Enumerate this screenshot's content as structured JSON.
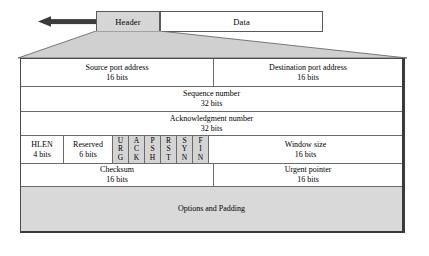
{
  "diagram": {
    "colors": {
      "shaded_fill": "#d9d9d9",
      "flag_fill": "#d4d4d4",
      "header_fill": "#d6d6d6",
      "data_fill": "#ffffff",
      "border": "#4a4a4a",
      "arrow": "#3b3b3b",
      "fan_fill": "#d0d0d0"
    },
    "segment": {
      "header_label": "Header",
      "data_label": "Data",
      "arrow_icon": "left-arrow-icon",
      "arrow_direction": "left"
    },
    "rows": [
      {
        "id": "ports",
        "cells": [
          {
            "name": "source-port",
            "line1": "Source port address",
            "line2": "16 bits",
            "shaded": false
          },
          {
            "name": "destination-port",
            "line1": "Destination port address",
            "line2": "16 bits",
            "shaded": false
          }
        ]
      },
      {
        "id": "sequence",
        "cells": [
          {
            "name": "sequence-number",
            "line1": "Sequence number",
            "line2": "32 bits",
            "shaded": false
          }
        ]
      },
      {
        "id": "acknowledgment",
        "cells": [
          {
            "name": "acknowledgment-number",
            "line1": "Acknowledgment number",
            "line2": "32 bits",
            "shaded": false
          }
        ]
      },
      {
        "id": "flags",
        "cells": [
          {
            "name": "hlen",
            "line1": "HLEN",
            "line2": "4 bits",
            "shaded": false
          },
          {
            "name": "reserved",
            "line1": "Reserved",
            "line2": "6 bits",
            "shaded": false
          },
          {
            "name": "window-size",
            "line1": "Window size",
            "line2": "16 bits",
            "shaded": false
          }
        ],
        "flags": [
          {
            "name": "flag-urg",
            "letters": [
              "U",
              "R",
              "G"
            ],
            "full": "URG"
          },
          {
            "name": "flag-ack",
            "letters": [
              "A",
              "C",
              "K"
            ],
            "full": "ACK"
          },
          {
            "name": "flag-psh",
            "letters": [
              "P",
              "S",
              "H"
            ],
            "full": "PSH"
          },
          {
            "name": "flag-rst",
            "letters": [
              "R",
              "S",
              "T"
            ],
            "full": "RST"
          },
          {
            "name": "flag-syn",
            "letters": [
              "S",
              "Y",
              "N"
            ],
            "full": "SYN"
          },
          {
            "name": "flag-fin",
            "letters": [
              "F",
              "I",
              "N"
            ],
            "full": "FIN"
          }
        ]
      },
      {
        "id": "checksum",
        "cells": [
          {
            "name": "checksum",
            "line1": "Checksum",
            "line2": "16 bits",
            "shaded": false
          },
          {
            "name": "urgent-pointer",
            "line1": "Urgent pointer",
            "line2": "16 bits",
            "shaded": false
          }
        ]
      },
      {
        "id": "options",
        "cells": [
          {
            "name": "options-and-padding",
            "line1": "Options and Padding",
            "line2": "",
            "shaded": true
          }
        ]
      }
    ]
  }
}
